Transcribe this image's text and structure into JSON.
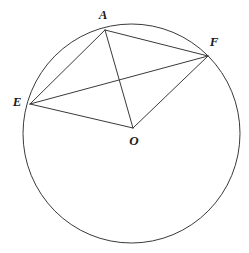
{
  "figure": {
    "type": "euclidean-geometry-diagram",
    "background_color": "#ffffff",
    "stroke_color": "#3a3a3a",
    "label_color": "#1a1a1a",
    "stroke_width": 1,
    "canvas": {
      "width": 249,
      "height": 253
    }
  },
  "circle": {
    "name": "main-circle",
    "center_x": 131.5,
    "center_y": 133.5,
    "radius_x": 108.5,
    "radius_y": 109.5
  },
  "points": [
    {
      "id": "A",
      "label": "A",
      "x": 105,
      "y": 30,
      "label_x": 103,
      "label_y": 16,
      "on_circle": true
    },
    {
      "id": "F",
      "label": "F",
      "x": 208,
      "y": 56,
      "label_x": 214,
      "label_y": 43,
      "on_circle": true
    },
    {
      "id": "E",
      "label": "E",
      "x": 30,
      "y": 104,
      "label_x": 17,
      "label_y": 103,
      "on_circle": true
    },
    {
      "id": "O",
      "label": "O",
      "x": 133,
      "y": 128,
      "label_x": 134,
      "label_y": 142,
      "on_circle": false
    }
  ],
  "segments": [
    {
      "id": "EA",
      "from": "E",
      "to": "A",
      "x1": 30,
      "y1": 104,
      "x2": 105,
      "y2": 30
    },
    {
      "id": "AF",
      "from": "A",
      "to": "F",
      "x1": 105,
      "y1": 30,
      "x2": 208,
      "y2": 56
    },
    {
      "id": "EF",
      "from": "E",
      "to": "F",
      "x1": 30,
      "y1": 104,
      "x2": 208,
      "y2": 56
    },
    {
      "id": "EO",
      "from": "E",
      "to": "O",
      "x1": 30,
      "y1": 104,
      "x2": 133,
      "y2": 128
    },
    {
      "id": "AO",
      "from": "A",
      "to": "O",
      "x1": 105,
      "y1": 30,
      "x2": 133,
      "y2": 128
    },
    {
      "id": "OF",
      "from": "O",
      "to": "F",
      "x1": 133,
      "y1": 128,
      "x2": 208,
      "y2": 56
    }
  ]
}
